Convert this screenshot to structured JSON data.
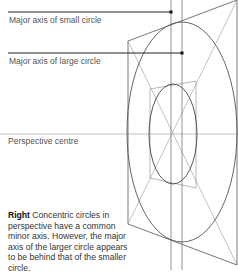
{
  "labels": {
    "small_axis": "Major axis of small circle",
    "large_axis": "Major axis of large circle",
    "perspective_centre": "Perspective centre"
  },
  "caption": {
    "lead": "Right",
    "text": " Concentric circles in perspective have a common minor axis. However, the major axis of the larger circle appears to be behind that of the smaller circle."
  },
  "colors": {
    "line_dark": "#222222",
    "line_mid": "#666666",
    "line_light": "#9a9a9a",
    "text": "#555555"
  }
}
